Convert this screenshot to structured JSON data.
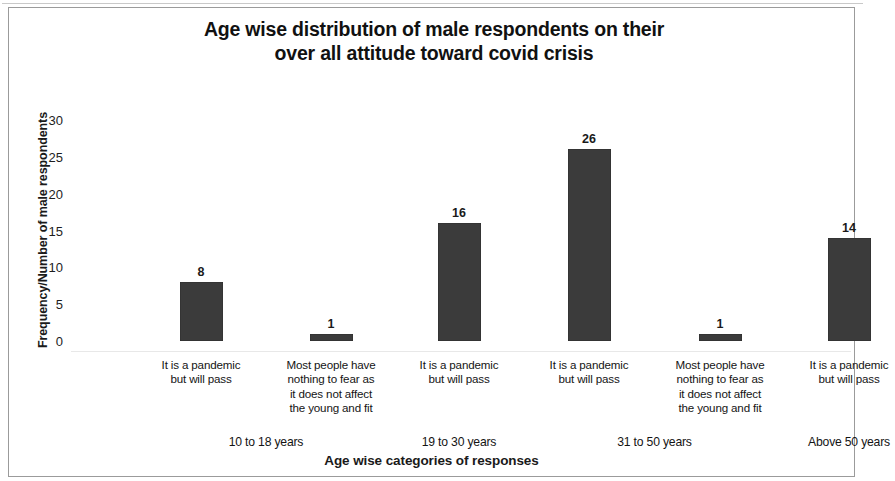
{
  "chart_data": {
    "type": "bar",
    "title": "Age wise distribution of male respondents on their\nover all attitude toward covid crisis",
    "xlabel": "Age wise categories of responses",
    "ylabel": "Frequency/Number of male respondents",
    "ylim": [
      0,
      30
    ],
    "y_ticks": [
      0,
      5,
      10,
      15,
      20,
      25,
      30
    ],
    "grid": false,
    "legend": null,
    "bar_color": "#3b3b3b",
    "categories": [
      "It is a pandemic but will pass",
      "Most people have nothing to fear as it does not affect the young and fit",
      "It is a pandemic but will pass",
      "It is a pandemic but will pass",
      "Most people have nothing to fear as it does not affect the young and fit",
      "It is a pandemic but will pass"
    ],
    "category_lines": [
      "It is a pandemic\nbut will pass",
      "Most people have\nnothing to fear as\nit does not affect\nthe young and fit",
      "It is a pandemic\nbut will pass",
      "It is a pandemic\nbut will pass",
      "Most people have\nnothing to fear as\nit does not affect\nthe young and fit",
      "It is a pandemic\nbut will pass"
    ],
    "values": [
      8,
      1,
      16,
      26,
      1,
      14
    ],
    "value_labels": [
      "8",
      "1",
      "16",
      "26",
      "1",
      "14"
    ],
    "groups": [
      {
        "label": "10 to 18 years",
        "bar_indices": [
          0,
          1
        ]
      },
      {
        "label": "19 to 30 years",
        "bar_indices": [
          2
        ]
      },
      {
        "label": "31 to 50 years",
        "bar_indices": [
          3,
          4
        ]
      },
      {
        "label": "Above 50 years",
        "bar_indices": [
          5
        ]
      }
    ],
    "group_labels": [
      "10 to 18 years",
      "19 to 30 years",
      "31 to 50 years",
      "Above 50 years"
    ]
  }
}
